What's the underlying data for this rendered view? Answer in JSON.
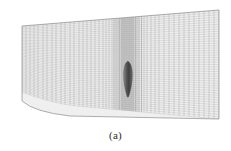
{
  "figure": {
    "caption": "(a)",
    "kind": "mesh-plot",
    "background_color": "#ffffff",
    "grid_line_color": "#9a9a9a",
    "grid_fill_color": "#eeeeee",
    "body_color": "#4a4a4a",
    "body_name": "airfoil-section"
  },
  "chart_data": {
    "type": "line",
    "subtitle": "",
    "xlabel": "",
    "ylabel": "",
    "grid": true,
    "legend": [],
    "annotations": [
      "(a)"
    ],
    "domain_outline": {
      "top_left": [
        22,
        26
      ],
      "top_right": [
        219,
        10
      ],
      "bottom_right": [
        219,
        119
      ],
      "bottom_left": [
        22,
        101
      ],
      "description": "Quadrilateral structured mesh block, slightly sheared, with curved lower-left boundary"
    },
    "xlim": [
      22,
      219
    ],
    "ylim": [
      10,
      119
    ],
    "clustering": {
      "axis": "x",
      "center": 128,
      "description": "Vertical grid lines clustered tightly around the airfoil at x=128, stretching outward toward both boundaries"
    },
    "series": [
      {
        "name": "i-grid-lines",
        "orientation": "vertical",
        "count": 61,
        "x": [
          22,
          26,
          30,
          34,
          38,
          43,
          47,
          52,
          56,
          61,
          65,
          70,
          74,
          79,
          83,
          87,
          91,
          95,
          99,
          103,
          106,
          109,
          112,
          114,
          116,
          118,
          119.5,
          121,
          122,
          123,
          124,
          125,
          126,
          127,
          128,
          129,
          130,
          131,
          132,
          133,
          134,
          135.5,
          137,
          139,
          141.5,
          144,
          147,
          151,
          155,
          159,
          164,
          169,
          174,
          179,
          184,
          189,
          194,
          199,
          204,
          209,
          214,
          219
        ]
      },
      {
        "name": "j-grid-lines",
        "orientation": "horizontal",
        "count": 46,
        "description": "Near-uniform horizontal family spanning the sheared block top to bottom"
      }
    ],
    "body": {
      "name": "airfoil-section",
      "x_range": [
        123.5,
        132.5
      ],
      "y_range": [
        61,
        97
      ],
      "shape": "slender tapering wedge, rounded at top, pointed at bottom"
    }
  }
}
